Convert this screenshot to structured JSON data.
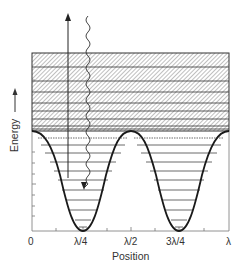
{
  "diagram": {
    "type": "energy-band diagram of periodic potential",
    "ylabel": "Energy",
    "xlabel": "Position",
    "xticks": [
      "0",
      "λ/4",
      "λ/2",
      "3λ/4",
      "λ"
    ],
    "elements": {
      "potential": "cosine-shaped double-well potential with minima at λ/4 and 3λ/4",
      "bound_levels": "horizontal discrete energy levels inside wells",
      "continuum_bands": "hatched energy bands above the potential barrier",
      "absorption_arrow": "vertical straight arrow pointing upward",
      "emission_photon": "wavy line ending in downward arrow"
    },
    "colors": {
      "line": "#222222",
      "hatch": "#555555",
      "background": "#ffffff"
    }
  }
}
